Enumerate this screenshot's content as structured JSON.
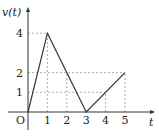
{
  "chart_data": {
    "type": "line",
    "title": "",
    "xlabel": "t",
    "ylabel": "v(t)",
    "origin_label": "O",
    "x": [
      0,
      1,
      3,
      5
    ],
    "series": [
      {
        "name": "v(t)",
        "values": [
          0,
          4,
          0,
          2
        ]
      }
    ],
    "xticks": [
      "1",
      "2",
      "3",
      "4",
      "5"
    ],
    "yticks": [
      "1",
      "2",
      "4"
    ],
    "xlim": [
      0,
      5.5
    ],
    "ylim": [
      0,
      4.5
    ],
    "grid": false,
    "guides": [
      {
        "type": "h",
        "y": 4,
        "from": 0,
        "to": 1
      },
      {
        "type": "h",
        "y": 2,
        "from": 0,
        "to": 5
      },
      {
        "type": "h",
        "y": 1,
        "from": 0,
        "to": 4
      },
      {
        "type": "v",
        "x": 1,
        "from": 0,
        "to": 4
      },
      {
        "type": "v",
        "x": 2,
        "from": 0,
        "to": 2
      },
      {
        "type": "v",
        "x": 4,
        "from": 0,
        "to": 1
      },
      {
        "type": "v",
        "x": 5,
        "from": 0,
        "to": 2
      }
    ]
  },
  "colors": {
    "line": "#333333",
    "axis": "#333333",
    "guide": "#999999"
  }
}
